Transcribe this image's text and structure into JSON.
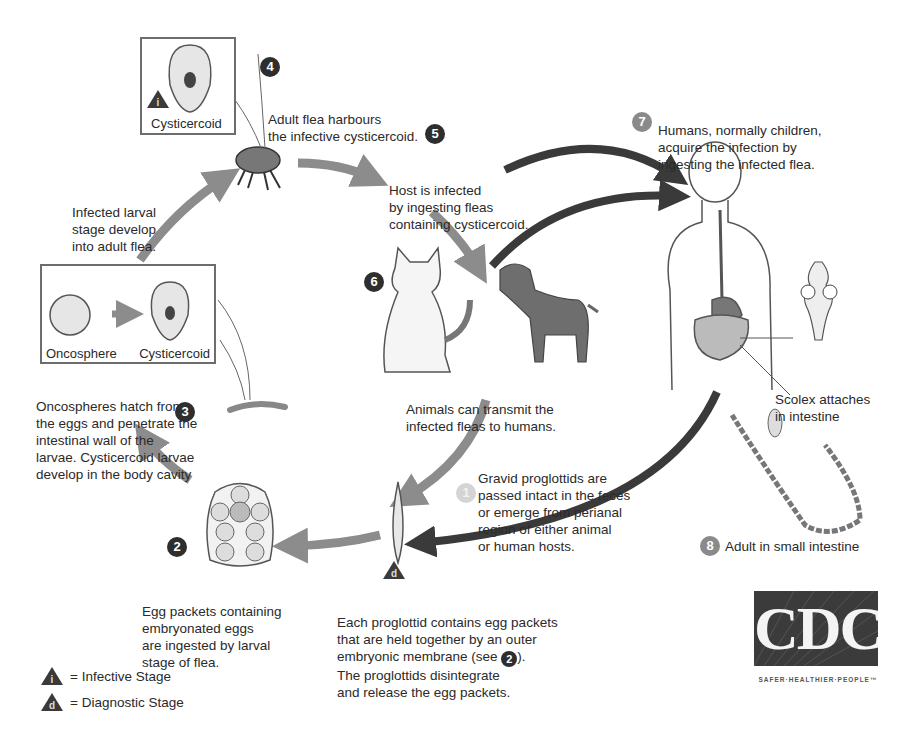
{
  "stages": {
    "s1": {
      "badge": "1",
      "lines": [
        "Gravid proglottids are",
        "passed intact in the feces",
        "or emerge from perianal",
        "region of either animal",
        "or human hosts."
      ]
    },
    "s2": {
      "badge": "2",
      "lines": [
        "Egg packets containing",
        "embryonated eggs",
        "are ingested by larval",
        "stage of flea."
      ]
    },
    "s3": {
      "badge": "3",
      "lines": [
        "Oncospheres hatch from",
        "the eggs and penetrate the",
        "intestinal wall of the",
        "larvae. Cysticercoid larvae",
        "develop in the body cavity"
      ]
    },
    "s4": {
      "badge": "4",
      "lines": [
        "Adult flea harbours",
        "the infective cysticercoid."
      ]
    },
    "s5": {
      "badge": "5",
      "lines": [
        "Host is infected",
        "by ingesting fleas",
        "containing cysticercoid."
      ]
    },
    "s6": {
      "badge": "6",
      "lines": [
        "Animals can transmit the",
        "infected fleas to humans."
      ]
    },
    "s7": {
      "badge": "7",
      "lines": [
        "Humans, normally children,",
        "acquire the infection by",
        "ingesting the infected flea."
      ]
    },
    "s8": {
      "badge": "8",
      "text": "Adult in small intestine"
    },
    "flea_dev": {
      "lines": [
        "Infected larval",
        "stage develop",
        "into adult flea."
      ]
    },
    "proglottid": {
      "lines": [
        "Each proglottid contains egg packets",
        "that are held together by an outer",
        "embryonic membrane (see ",
        "The proglottids disintegrate",
        "and release the egg packets."
      ],
      "see_badge": "2",
      "see_close": ")."
    },
    "scolex": {
      "lines": [
        "Scolex attaches",
        "in intestine"
      ]
    }
  },
  "boxes": {
    "top_cysticercoid": "Cysticercoid",
    "oncosphere": "Oncosphere",
    "left_cysticercoid": "Cysticercoid"
  },
  "markers": {
    "infective": "i",
    "diagnostic": "d"
  },
  "legend": {
    "infective": "= Infective Stage",
    "diagnostic": "= Diagnostic Stage"
  },
  "logo": {
    "text": "CDC",
    "tagline": "SAFER·HEALTHIER·PEOPLE™"
  },
  "colors": {
    "dark_arrow": "#3a3a3a",
    "grey_arrow": "#8c8c8c",
    "badge_dark": "#2e2e2e"
  }
}
